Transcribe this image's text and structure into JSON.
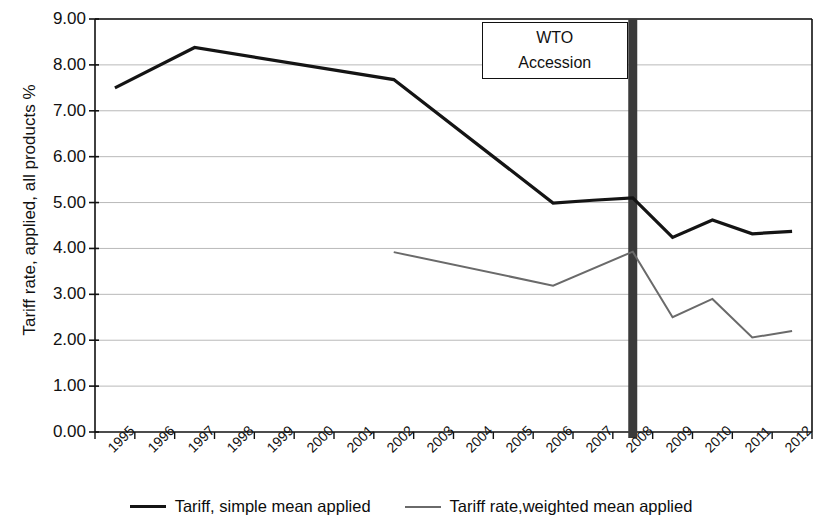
{
  "chart_data": {
    "type": "line",
    "title": "",
    "xlabel": "",
    "ylabel": "Tariff rate, applied, all products %",
    "ylim": [
      0,
      9
    ],
    "ytick_labels": [
      "0.00",
      "1.00",
      "2.00",
      "3.00",
      "4.00",
      "5.00",
      "6.00",
      "7.00",
      "8.00",
      "9.00"
    ],
    "ytick_values": [
      0,
      1,
      2,
      3,
      4,
      5,
      6,
      7,
      8,
      9
    ],
    "grid": "horizontal",
    "legend_position": "bottom",
    "categories": [
      "1995",
      "1996",
      "1997",
      "1998",
      "1999",
      "2000",
      "2001",
      "2002",
      "2003",
      "2004",
      "2005",
      "2006",
      "2007",
      "2008",
      "2009",
      "2010",
      "2011",
      "2012"
    ],
    "series": [
      {
        "name": "Tariff, simple mean applied",
        "color": "#141414",
        "values": [
          7.5,
          null,
          8.38,
          null,
          null,
          null,
          null,
          7.68,
          null,
          null,
          null,
          4.99,
          5.05,
          5.1,
          4.24,
          4.62,
          4.32,
          4.37
        ]
      },
      {
        "name": "Tariff rate,weighted mean applied",
        "color": "#6a6a6a",
        "values": [
          null,
          null,
          null,
          null,
          null,
          null,
          null,
          3.92,
          null,
          null,
          null,
          3.19,
          null,
          3.93,
          2.5,
          2.9,
          2.06,
          2.2
        ]
      }
    ],
    "annotations": [
      {
        "name": "wto-accession",
        "line1": "WTO",
        "line2": "Accession",
        "marker_category": "2008",
        "marker_color": "#3a3a3a"
      }
    ]
  },
  "legend": {
    "items": [
      {
        "label": "Tariff, simple mean applied",
        "swatch": "dark"
      },
      {
        "label": "Tariff rate,weighted mean applied",
        "swatch": "gray"
      }
    ]
  }
}
